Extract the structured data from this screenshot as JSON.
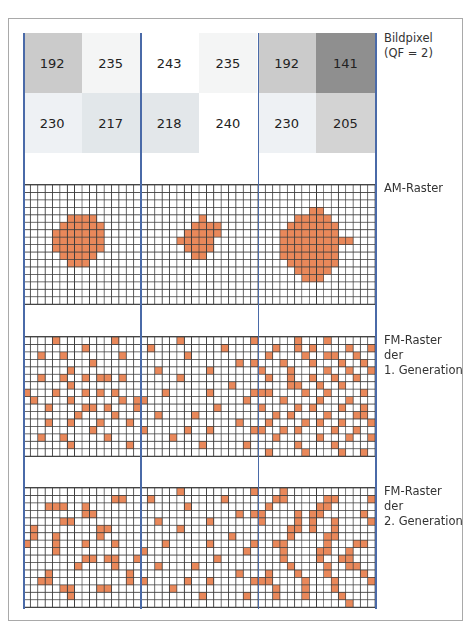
{
  "labels": {
    "pixels": [
      "Bildpixel",
      "(QF = 2)"
    ],
    "am": [
      "AM-Raster"
    ],
    "fm1": [
      "FM-Raster",
      "der",
      "1. Generation"
    ],
    "fm2": [
      "FM-Raster",
      "der",
      "2. Generation"
    ]
  },
  "colors": {
    "frame": "#a9a9a9",
    "divider": "#4a6aa8",
    "grid_line": "#3c3c3c",
    "dot": "#e9885a"
  },
  "pixels": [
    {
      "value": "192",
      "bg": "#cbcbcb"
    },
    {
      "value": "235",
      "bg": "#f4f5f5"
    },
    {
      "value": "243",
      "bg": "#ffffff"
    },
    {
      "value": "235",
      "bg": "#f4f5f5"
    },
    {
      "value": "192",
      "bg": "#cbcbcb"
    },
    {
      "value": "141",
      "bg": "#8f8f8f"
    },
    {
      "value": "230",
      "bg": "#eef1f4"
    },
    {
      "value": "217",
      "bg": "#e2e7ea"
    },
    {
      "value": "218",
      "bg": "#e3e7ea"
    },
    {
      "value": "240",
      "bg": "#ffffff"
    },
    {
      "value": "230",
      "bg": "#eef1f4"
    },
    {
      "value": "205",
      "bg": "#d3d3d3"
    }
  ],
  "grids": {
    "cols": 16,
    "rows": 17,
    "am": [
      {
        "rows": {
          "4": [
            6,
            9
          ],
          "5": [
            5,
            10
          ],
          "6": [
            4,
            10
          ],
          "7": [
            4,
            10
          ],
          "8": [
            4,
            10
          ],
          "9": [
            5,
            9
          ],
          "10": [
            6,
            8
          ]
        }
      },
      {
        "rows": {
          "4": [
            8,
            8
          ],
          "5": [
            7,
            10
          ],
          "6": [
            6,
            10
          ],
          "7": [
            5,
            9
          ],
          "8": [
            6,
            9
          ],
          "9": [
            7,
            8
          ]
        }
      },
      {
        "rows": {
          "3": [
            7,
            8
          ],
          "4": [
            5,
            9
          ],
          "5": [
            4,
            10
          ],
          "6": [
            3,
            10
          ],
          "7": [
            3,
            12
          ],
          "8": [
            3,
            10
          ],
          "9": [
            3,
            10
          ],
          "10": [
            4,
            10
          ],
          "11": [
            5,
            9
          ],
          "12": [
            6,
            8
          ]
        }
      }
    ],
    "fm1": [
      [
        [
          0,
          4
        ],
        [
          0,
          12
        ],
        [
          1,
          8
        ],
        [
          2,
          2
        ],
        [
          2,
          5
        ],
        [
          2,
          13
        ],
        [
          3,
          9
        ],
        [
          4,
          6
        ],
        [
          5,
          2
        ],
        [
          5,
          5
        ],
        [
          5,
          8
        ],
        [
          5,
          10
        ],
        [
          5,
          11
        ],
        [
          5,
          13
        ],
        [
          6,
          6
        ],
        [
          7,
          0
        ],
        [
          7,
          4
        ],
        [
          7,
          8
        ],
        [
          7,
          10
        ],
        [
          7,
          12
        ],
        [
          8,
          1
        ],
        [
          8,
          6
        ],
        [
          8,
          13
        ],
        [
          8,
          15
        ],
        [
          9,
          3
        ],
        [
          9,
          8
        ],
        [
          9,
          9
        ],
        [
          9,
          11
        ],
        [
          9,
          15
        ],
        [
          10,
          7
        ],
        [
          10,
          12
        ],
        [
          11,
          3
        ],
        [
          11,
          6
        ],
        [
          11,
          10
        ],
        [
          11,
          14
        ],
        [
          12,
          9
        ],
        [
          13,
          2
        ],
        [
          13,
          5
        ],
        [
          13,
          11
        ],
        [
          14,
          6
        ],
        [
          14,
          14
        ]
      ],
      [
        [
          0,
          5
        ],
        [
          0,
          15
        ],
        [
          1,
          1
        ],
        [
          1,
          11
        ],
        [
          2,
          6
        ],
        [
          3,
          13
        ],
        [
          3,
          15
        ],
        [
          4,
          2
        ],
        [
          4,
          9
        ],
        [
          5,
          5
        ],
        [
          6,
          12
        ],
        [
          7,
          3
        ],
        [
          7,
          9
        ],
        [
          7,
          15
        ],
        [
          8,
          0
        ],
        [
          8,
          14
        ],
        [
          9,
          10
        ],
        [
          10,
          2
        ],
        [
          10,
          7
        ],
        [
          11,
          13
        ],
        [
          12,
          0
        ],
        [
          12,
          6
        ],
        [
          12,
          9
        ],
        [
          12,
          15
        ],
        [
          13,
          4
        ],
        [
          14,
          8
        ],
        [
          14,
          14
        ]
      ],
      [
        [
          0,
          5
        ],
        [
          0,
          9
        ],
        [
          1,
          2
        ],
        [
          1,
          5
        ],
        [
          1,
          7
        ],
        [
          1,
          12
        ],
        [
          1,
          15
        ],
        [
          2,
          1
        ],
        [
          2,
          6
        ],
        [
          2,
          9
        ],
        [
          2,
          10
        ],
        [
          2,
          13
        ],
        [
          3,
          3
        ],
        [
          3,
          7
        ],
        [
          3,
          11
        ],
        [
          3,
          14
        ],
        [
          4,
          0
        ],
        [
          4,
          4
        ],
        [
          4,
          9
        ],
        [
          4,
          12
        ],
        [
          4,
          15
        ],
        [
          5,
          1
        ],
        [
          5,
          4
        ],
        [
          5,
          7
        ],
        [
          5,
          10
        ],
        [
          5,
          13
        ],
        [
          6,
          4
        ],
        [
          6,
          5
        ],
        [
          6,
          8
        ],
        [
          6,
          11
        ],
        [
          7,
          0
        ],
        [
          7,
          1
        ],
        [
          7,
          6
        ],
        [
          7,
          9
        ],
        [
          7,
          14
        ],
        [
          8,
          3
        ],
        [
          8,
          8
        ],
        [
          8,
          12
        ],
        [
          9,
          0
        ],
        [
          9,
          5
        ],
        [
          9,
          7
        ],
        [
          9,
          11
        ],
        [
          9,
          14
        ],
        [
          10,
          2
        ],
        [
          10,
          4
        ],
        [
          10,
          9
        ],
        [
          10,
          13
        ],
        [
          10,
          14
        ],
        [
          11,
          1
        ],
        [
          11,
          6
        ],
        [
          11,
          8
        ],
        [
          11,
          11
        ],
        [
          11,
          15
        ],
        [
          12,
          0
        ],
        [
          12,
          3
        ],
        [
          12,
          5
        ],
        [
          12,
          10
        ],
        [
          12,
          13
        ],
        [
          13,
          2
        ],
        [
          13,
          8
        ],
        [
          13,
          12
        ],
        [
          13,
          15
        ],
        [
          14,
          5
        ],
        [
          14,
          10
        ],
        [
          15,
          1
        ],
        [
          15,
          6
        ],
        [
          15,
          11
        ],
        [
          15,
          14
        ]
      ]
    ],
    "fm2": [
      [
        [
          1,
          12
        ],
        [
          1,
          13
        ],
        [
          2,
          3
        ],
        [
          2,
          4
        ],
        [
          2,
          5
        ],
        [
          2,
          8
        ],
        [
          3,
          8
        ],
        [
          3,
          9
        ],
        [
          4,
          5
        ],
        [
          4,
          6
        ],
        [
          5,
          1
        ],
        [
          5,
          10
        ],
        [
          5,
          11
        ],
        [
          6,
          1
        ],
        [
          6,
          4
        ],
        [
          6,
          10
        ],
        [
          7,
          0
        ],
        [
          7,
          4
        ],
        [
          7,
          8
        ],
        [
          7,
          12
        ],
        [
          8,
          4
        ],
        [
          9,
          8
        ],
        [
          9,
          9
        ],
        [
          9,
          11
        ],
        [
          9,
          12
        ],
        [
          9,
          15
        ],
        [
          10,
          7
        ],
        [
          10,
          12
        ],
        [
          11,
          3
        ],
        [
          11,
          14
        ],
        [
          12,
          2
        ],
        [
          12,
          3
        ],
        [
          12,
          14
        ],
        [
          13,
          5
        ],
        [
          13,
          6
        ],
        [
          13,
          10
        ],
        [
          13,
          11
        ],
        [
          14,
          6
        ]
      ],
      [
        [
          0,
          5
        ],
        [
          0,
          15
        ],
        [
          1,
          1
        ],
        [
          1,
          11
        ],
        [
          2,
          6
        ],
        [
          3,
          13
        ],
        [
          3,
          15
        ],
        [
          4,
          2
        ],
        [
          4,
          9
        ],
        [
          5,
          5
        ],
        [
          6,
          12
        ],
        [
          7,
          3
        ],
        [
          7,
          9
        ],
        [
          7,
          15
        ],
        [
          8,
          0
        ],
        [
          8,
          14
        ],
        [
          9,
          10
        ],
        [
          10,
          2
        ],
        [
          10,
          7
        ],
        [
          11,
          13
        ],
        [
          12,
          0
        ],
        [
          12,
          6
        ],
        [
          12,
          9
        ],
        [
          12,
          15
        ],
        [
          13,
          4
        ],
        [
          14,
          8
        ],
        [
          14,
          14
        ]
      ],
      [
        [
          0,
          3
        ],
        [
          1,
          2
        ],
        [
          1,
          3
        ],
        [
          1,
          9
        ],
        [
          1,
          10
        ],
        [
          1,
          15
        ],
        [
          2,
          1
        ],
        [
          2,
          8
        ],
        [
          2,
          9
        ],
        [
          3,
          0
        ],
        [
          3,
          5
        ],
        [
          3,
          7
        ],
        [
          3,
          8
        ],
        [
          3,
          14
        ],
        [
          4,
          0
        ],
        [
          4,
          5
        ],
        [
          4,
          7
        ],
        [
          4,
          10
        ],
        [
          4,
          15
        ],
        [
          5,
          4
        ],
        [
          5,
          5
        ],
        [
          5,
          7
        ],
        [
          5,
          10
        ],
        [
          6,
          4
        ],
        [
          6,
          9
        ],
        [
          6,
          10
        ],
        [
          7,
          2
        ],
        [
          7,
          3
        ],
        [
          7,
          9
        ],
        [
          7,
          13
        ],
        [
          7,
          14
        ],
        [
          8,
          3
        ],
        [
          8,
          8
        ],
        [
          8,
          9
        ],
        [
          8,
          12
        ],
        [
          9,
          3
        ],
        [
          9,
          8
        ],
        [
          9,
          11
        ],
        [
          9,
          12
        ],
        [
          10,
          4
        ],
        [
          10,
          9
        ],
        [
          10,
          12
        ],
        [
          10,
          13
        ],
        [
          11,
          1
        ],
        [
          11,
          5
        ],
        [
          11,
          9
        ],
        [
          11,
          14
        ],
        [
          12,
          0
        ],
        [
          12,
          1
        ],
        [
          12,
          6
        ],
        [
          12,
          10
        ],
        [
          12,
          15
        ],
        [
          13,
          2
        ],
        [
          13,
          6
        ],
        [
          13,
          10
        ],
        [
          14,
          2
        ],
        [
          14,
          6
        ],
        [
          14,
          11
        ],
        [
          15,
          12
        ]
      ]
    ]
  }
}
